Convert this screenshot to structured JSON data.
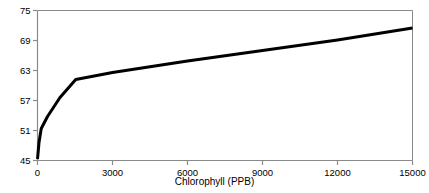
{
  "chart_data": {
    "type": "line",
    "title": "",
    "xlabel": "Chlorophyll (PPB)",
    "ylabel": "",
    "xlim": [
      0,
      15000
    ],
    "ylim": [
      45,
      75
    ],
    "xticks": [
      0,
      3000,
      6000,
      9000,
      12000,
      15000
    ],
    "yticks": [
      45,
      51,
      57,
      63,
      69,
      75
    ],
    "xtick_labels": [
      "0",
      "3000",
      "6000",
      "9000",
      "12000",
      "15000"
    ],
    "ytick_labels": [
      "45",
      "51",
      "57",
      "63",
      "69",
      "75"
    ],
    "grid": false,
    "legend": false,
    "line_color": "#000000",
    "line_width": 3,
    "axis_color": "#8a8a8a",
    "background": "#ffffff",
    "series": [
      {
        "name": "chlorophyll-response",
        "x": [
          0,
          60,
          150,
          400,
          900,
          1530,
          3000,
          6000,
          9000,
          12000,
          15000
        ],
        "y": [
          45.3,
          48.6,
          51.4,
          53.8,
          57.6,
          61.2,
          62.6,
          64.9,
          67.0,
          69.1,
          71.5
        ]
      }
    ]
  }
}
